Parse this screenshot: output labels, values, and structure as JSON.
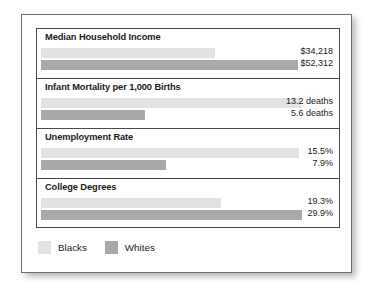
{
  "chart_data": {
    "type": "bar",
    "title": "",
    "orientation": "horizontal",
    "grid": false,
    "legend_position": "bottom-left",
    "legend": [
      {
        "name": "Blacks",
        "color": "#e2e2e2"
      },
      {
        "name": "Whites",
        "color": "#a9a9a9"
      }
    ],
    "categories": [
      "Median Household Income",
      "Infant Mortality per 1,000 Births",
      "Unemployment Rate",
      "College Degrees"
    ],
    "series": [
      {
        "name": "Blacks",
        "color": "#e2e2e2",
        "values": [
          34218,
          13.2,
          15.5,
          19.3
        ],
        "labels": [
          "$34,218",
          "13.2 deaths",
          "15.5%",
          "19.3%"
        ],
        "bar_pct": [
          57.5,
          86.0,
          85.4,
          59.5
        ]
      },
      {
        "name": "Whites",
        "color": "#a9a9a9",
        "values": [
          52312,
          5.6,
          7.9,
          29.9
        ],
        "labels": [
          "$52,312",
          "5.6 deaths",
          "7.9%",
          "29.9%"
        ],
        "bar_pct": [
          85.0,
          34.5,
          41.5,
          86.5
        ]
      }
    ],
    "groups": [
      {
        "title": "Median Household Income",
        "unit": "dollars",
        "rows": [
          {
            "series": "Blacks",
            "value": 34218,
            "label": "$34,218",
            "bar_pct": 57.5
          },
          {
            "series": "Whites",
            "value": 52312,
            "label": "$52,312",
            "bar_pct": 85.0
          }
        ]
      },
      {
        "title": "Infant Mortality per 1,000 Births",
        "unit": "deaths per 1,000 births",
        "rows": [
          {
            "series": "Blacks",
            "value": 13.2,
            "label": "13.2 deaths",
            "bar_pct": 86.0
          },
          {
            "series": "Whites",
            "value": 5.6,
            "label": "5.6 deaths",
            "bar_pct": 34.5
          }
        ]
      },
      {
        "title": "Unemployment Rate",
        "unit": "percent",
        "rows": [
          {
            "series": "Blacks",
            "value": 15.5,
            "label": "15.5%",
            "bar_pct": 85.4
          },
          {
            "series": "Whites",
            "value": 7.9,
            "label": "7.9%",
            "bar_pct": 41.5
          }
        ]
      },
      {
        "title": "College Degrees",
        "unit": "percent",
        "rows": [
          {
            "series": "Blacks",
            "value": 19.3,
            "label": "19.3%",
            "bar_pct": 59.5
          },
          {
            "series": "Whites",
            "value": 29.9,
            "label": "29.9%",
            "bar_pct": 86.5
          }
        ]
      }
    ]
  }
}
